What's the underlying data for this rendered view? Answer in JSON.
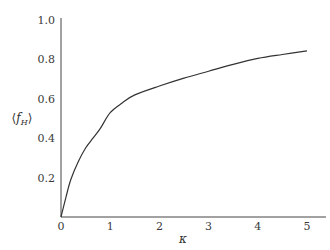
{
  "chart_data": {
    "type": "line",
    "title": "",
    "xlabel": "κ",
    "ylabel": "⟨f_H⟩",
    "xlim": [
      0,
      5
    ],
    "ylim": [
      0,
      1.0
    ],
    "grid": false,
    "legend": null,
    "x_ticks": [
      "0",
      "1",
      "2",
      "3",
      "4",
      "5"
    ],
    "y_ticks": [
      "0.2",
      "0.4",
      "0.6",
      "0.8",
      "1.0"
    ],
    "series": [
      {
        "name": "⟨f_H⟩(κ)",
        "x": [
          0,
          0.1,
          0.2,
          0.35,
          0.5,
          0.65,
          0.8,
          1.0,
          1.25,
          1.5,
          2.0,
          2.5,
          3.0,
          3.5,
          4.0,
          4.5,
          5.0
        ],
        "values": [
          0,
          0.1,
          0.19,
          0.28,
          0.35,
          0.4,
          0.45,
          0.53,
          0.58,
          0.62,
          0.665,
          0.705,
          0.74,
          0.775,
          0.805,
          0.825,
          0.843
        ]
      }
    ]
  },
  "labels": {
    "xlabel": "κ",
    "ylabel_main": "f",
    "ylabel_sub": "H",
    "ylabel_open": "⟨",
    "ylabel_close": "⟩"
  }
}
